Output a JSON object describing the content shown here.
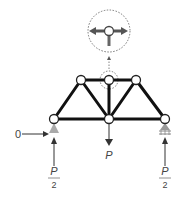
{
  "diagram": {
    "labels": {
      "left_horizontal_reaction": "0",
      "center_load": "P",
      "left_reaction_num": "P",
      "left_reaction_den": "2",
      "right_reaction_num": "P",
      "right_reaction_den": "2"
    },
    "nodes": [
      {
        "id": "bottom-left",
        "x": 54,
        "y": 119
      },
      {
        "id": "bottom-mid",
        "x": 109,
        "y": 119
      },
      {
        "id": "bottom-right",
        "x": 165,
        "y": 119
      },
      {
        "id": "top-left",
        "x": 81,
        "y": 80
      },
      {
        "id": "top-mid",
        "x": 109,
        "y": 80
      },
      {
        "id": "top-right",
        "x": 136,
        "y": 80
      }
    ],
    "colors": {
      "member": "#111111",
      "load_arrow": "#333333",
      "support": "#999999",
      "detail_arrow": "#555555",
      "dotted": "#777777"
    }
  }
}
